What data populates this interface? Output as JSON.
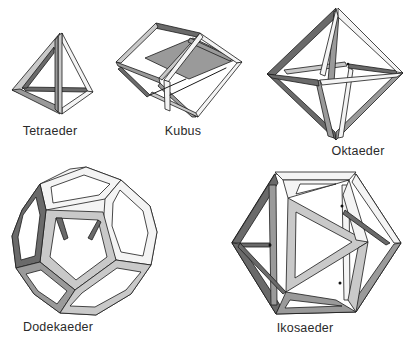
{
  "solids": [
    {
      "id": "tetraeder",
      "label": "Tetraeder",
      "faces": 4
    },
    {
      "id": "kubus",
      "label": "Kubus",
      "faces": 6
    },
    {
      "id": "oktaeder",
      "label": "Oktaeder",
      "faces": 8
    },
    {
      "id": "dodekaeder",
      "label": "Dodekaeder",
      "faces": 12
    },
    {
      "id": "ikosaeder",
      "label": "Ikosaeder",
      "faces": 20
    }
  ],
  "colors": {
    "background": "#ffffff",
    "frame_light": "#c9c9c9",
    "frame_mid": "#9a9a9a",
    "frame_dark": "#6a6a6a",
    "outline": "#1a1a1a",
    "label": "#2a2a2a"
  }
}
